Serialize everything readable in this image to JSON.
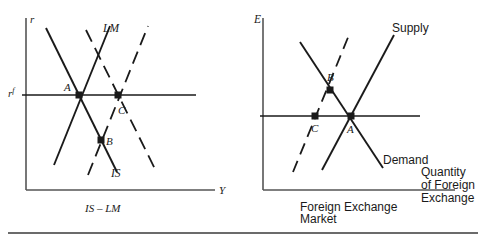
{
  "figure": {
    "background": "#ffffff",
    "ink": "#1a1a1a",
    "rule_color": "#6b6b6b",
    "width": 486,
    "height": 242
  },
  "left_panel": {
    "name": "IS-LM diagram",
    "caption": "IS – LM",
    "y_axis_label": "r",
    "x_axis_label": "Y",
    "world_rate_label": "r",
    "world_rate_superscript": "f",
    "curve_labels": {
      "lm": "LM",
      "is": "IS"
    },
    "points": [
      {
        "label": "A",
        "x": 79,
        "y": 95
      },
      {
        "label": "B",
        "x": 101,
        "y": 140
      },
      {
        "label": "C",
        "x": 118,
        "y": 95
      }
    ],
    "axes": {
      "origin_x": 26,
      "origin_y": 190,
      "top_y": 18,
      "right_x": 215
    },
    "world_rate_line_y": 95
  },
  "right_panel": {
    "name": "Foreign exchange market diagram",
    "caption_line1": "Foreign Exchange",
    "caption_line2": "Market",
    "y_axis_label": "E",
    "x_axis_label_lines": [
      "Quantity",
      "of Foreign",
      "Exchange"
    ],
    "curve_labels": {
      "supply": "Supply",
      "demand": "Demand"
    },
    "points": [
      {
        "label": "B",
        "x": 330,
        "y": 90
      },
      {
        "label": "C",
        "x": 315,
        "y": 116
      },
      {
        "label": "A",
        "x": 351,
        "y": 116
      }
    ],
    "axes": {
      "origin_x": 263,
      "origin_y": 190,
      "top_y": 18,
      "right_x": 455
    },
    "rate_line_y": 116
  }
}
